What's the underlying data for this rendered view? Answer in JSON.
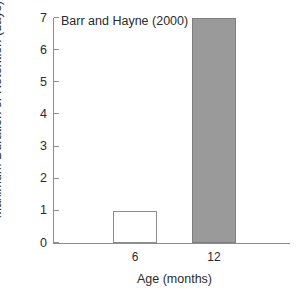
{
  "chart_data": {
    "type": "bar",
    "title": "",
    "annotation": "Barr and Hayne (2000)",
    "categories": [
      "6",
      "12"
    ],
    "values": [
      1,
      7
    ],
    "xlabel": "Age (months)",
    "ylabel": "Maximum Duration of Retention (days)",
    "ylim": [
      0,
      7
    ],
    "yticks": [
      "0",
      "1",
      "2",
      "3",
      "4",
      "5",
      "6",
      "7"
    ],
    "grid": false,
    "legend": false,
    "bars": [
      {
        "category": "6",
        "value": 1,
        "fill": "#ffffff",
        "border": "#8d8d8d"
      },
      {
        "category": "12",
        "value": 7,
        "fill": "#9a9a9a",
        "border": "#7e7e7e"
      }
    ],
    "axis_color": "#8d8d8d",
    "text_color": "#2b2b2b"
  }
}
